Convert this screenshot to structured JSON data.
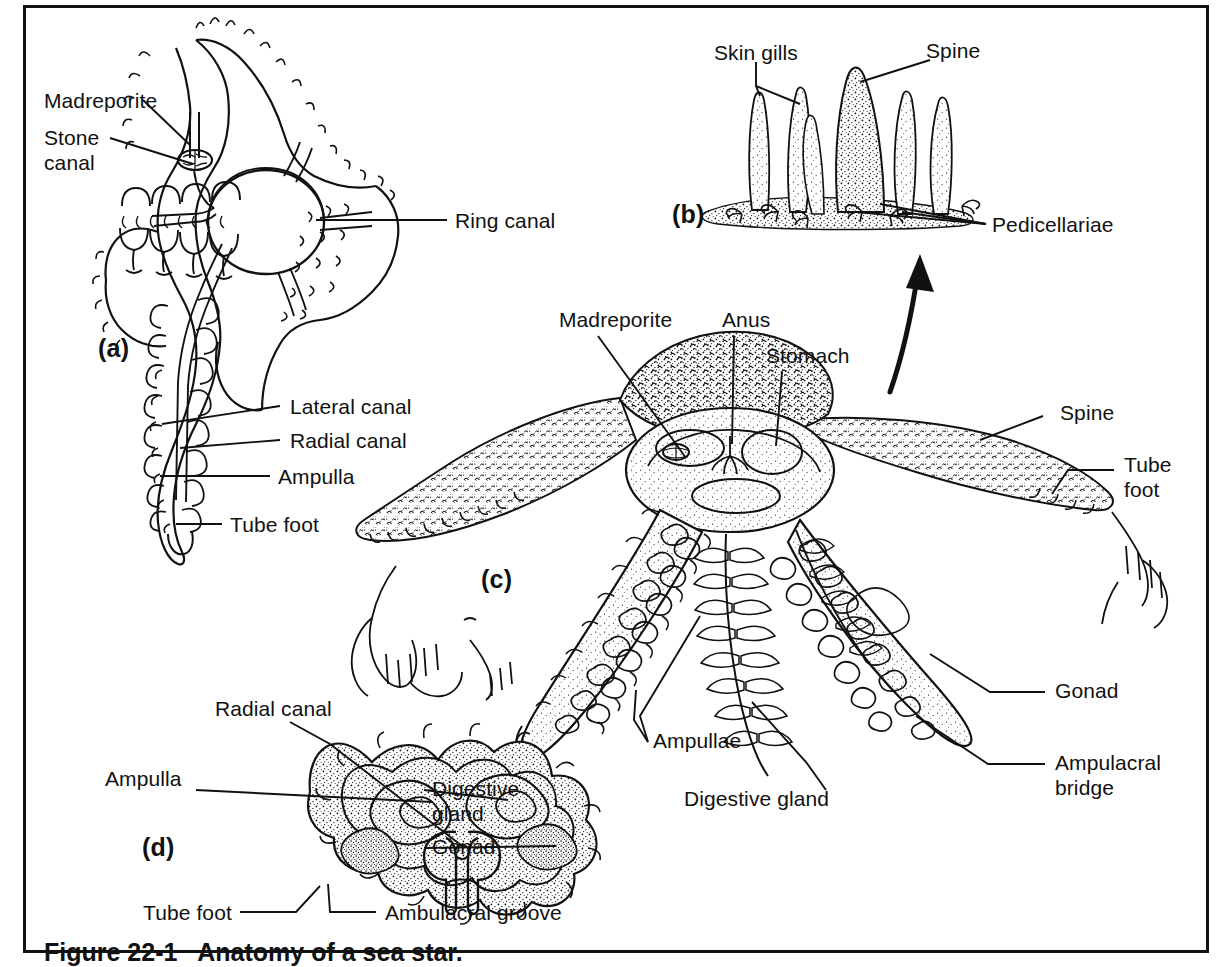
{
  "figure": {
    "caption_partial": "Figure 22-1   Anatomy of a sea star.",
    "border_color": "#111111",
    "ink_color": "#111111",
    "background": "#ffffff",
    "panel_tags": {
      "a": "(a)",
      "b": "(b)",
      "c": "(c)",
      "d": "(d)"
    }
  },
  "panel_a": {
    "tag": "(a)",
    "description": "Water vascular system of a sea star, aboral view",
    "labels": {
      "madreporite": "Madreporite",
      "stone_canal": "Stone\ncanal",
      "ring_canal": "Ring canal",
      "lateral_canal": "Lateral canal",
      "radial_canal": "Radial canal",
      "ampulla": "Ampulla",
      "tube_foot": "Tube foot"
    }
  },
  "panel_b": {
    "tag": "(b)",
    "description": "Detail of aboral body surface showing skin gills, spine and pedicellariae",
    "labels": {
      "skin_gills": "Skin gills",
      "spine": "Spine",
      "pedicellariae": "Pedicellariae"
    }
  },
  "panel_c": {
    "tag": "(c)",
    "description": "Dissected sea star showing internal organs",
    "labels": {
      "madreporite": "Madreporite",
      "anus": "Anus",
      "stomach": "Stomach",
      "spine": "Spine",
      "tube_foot": "Tube\nfoot",
      "gonad": "Gonad",
      "ampulacral_bridge": "Ampulacral\nbridge",
      "ampullae": "Ampullae",
      "digestive_gland": "Digestive gland"
    }
  },
  "panel_d": {
    "tag": "(d)",
    "description": "Cross section through an arm of a sea star",
    "labels": {
      "radial_canal": "Radial canal",
      "ampulla": "Ampulla",
      "digestive_gland": "Digestive\ngland",
      "gonad": "Gonad",
      "tube_foot": "Tube foot",
      "ambulacral_groove": "Ambulacral groove"
    }
  }
}
